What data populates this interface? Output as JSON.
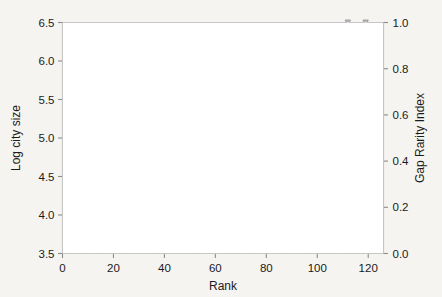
{
  "chart_data": {
    "type": "scatter",
    "title": "",
    "subtitle": "",
    "xlabel": "Rank",
    "ylabel": "Log city size",
    "y2label": "Gap Rarity Index",
    "xlim": [
      0,
      126
    ],
    "ylim": [
      3.5,
      6.5
    ],
    "y2lim": [
      0.0,
      1.0
    ],
    "xticks": [
      0,
      20,
      40,
      60,
      80,
      100,
      120
    ],
    "xticklabels": [
      "0",
      "20",
      "40",
      "60",
      "80",
      "100",
      "120"
    ],
    "yticks": [
      3.5,
      4.0,
      4.5,
      5.0,
      5.5,
      6.0,
      6.5
    ],
    "yticklabels": [
      "3.5",
      "4.0",
      "4.5",
      "5.0",
      "5.5",
      "6.0",
      "6.5"
    ],
    "y2ticks": [
      0.0,
      0.2,
      0.4,
      0.6,
      0.8,
      1.0
    ],
    "y2ticklabels": [
      "0.0",
      "0.2",
      "0.4",
      "0.6",
      "0.8",
      "1.0"
    ],
    "grid": false,
    "legend": null,
    "colors": {
      "city_size_series": "#111111",
      "gap_rarity_series": "#9a9a9a",
      "frame": "#8c8c8c",
      "background": "#f5f4f1"
    },
    "series": [
      {
        "name": "Log city size",
        "axis": "left",
        "marker": "filled-circle",
        "values": [
          4.02,
          4.03,
          4.04,
          4.05,
          4.06,
          4.07,
          4.08,
          4.09,
          4.1,
          4.11,
          4.12,
          4.12,
          4.13,
          4.14,
          4.14,
          4.15,
          4.16,
          4.17,
          4.17,
          4.18,
          4.19,
          4.2,
          4.21,
          4.22,
          4.23,
          4.24,
          4.24,
          4.25,
          4.25,
          4.26,
          4.26,
          4.27,
          4.27,
          4.28,
          4.28,
          4.29,
          4.29,
          4.3,
          4.3,
          4.31,
          4.31,
          4.32,
          4.32,
          4.33,
          4.34,
          4.35,
          4.4,
          4.42,
          4.44,
          4.45,
          4.46,
          4.47,
          4.48,
          4.49,
          4.5,
          4.51,
          4.52,
          4.53,
          4.54,
          4.55,
          4.56,
          4.57,
          4.58,
          4.59,
          4.6,
          4.61,
          4.62,
          4.63,
          4.64,
          4.65,
          4.66,
          4.67,
          4.68,
          4.69,
          4.7,
          4.71,
          4.72,
          4.73,
          4.75,
          4.77,
          4.79,
          4.8,
          4.82,
          4.84,
          4.85,
          4.87,
          4.88,
          4.9,
          4.91,
          4.93,
          4.95,
          4.96,
          4.98,
          4.99,
          5.0,
          5.02,
          5.04,
          5.06,
          5.08,
          5.1,
          5.12,
          5.14,
          5.16,
          5.18,
          5.22,
          5.26,
          5.3,
          5.42,
          5.56,
          5.58,
          5.62,
          5.64,
          5.68,
          5.72,
          5.76,
          5.8,
          5.83,
          5.87,
          5.93,
          5.97,
          6.02,
          6.05,
          6.08,
          6.25
        ]
      },
      {
        "name": "Gap Rarity Index",
        "axis": "right",
        "marker": "down-triangle-stem",
        "values": [
          0.02,
          0.01,
          0.02,
          0.01,
          0.02,
          0.01,
          0.02,
          0.01,
          0.02,
          0.05,
          0.01,
          0.02,
          0.01,
          0.02,
          0.01,
          0.02,
          0.01,
          0.02,
          0.01,
          0.02,
          0.04,
          0.01,
          0.02,
          0.01,
          0.3,
          0.01,
          0.02,
          0.01,
          0.02,
          0.01,
          0.02,
          0.01,
          0.02,
          0.01,
          0.02,
          0.04,
          0.01,
          0.02,
          0.04,
          0.01,
          0.02,
          0.01,
          0.02,
          0.01,
          0.11,
          0.01,
          0.47,
          0.02,
          0.01,
          0.08,
          0.02,
          0.1,
          0.01,
          0.02,
          0.11,
          0.01,
          0.13,
          0.02,
          0.01,
          0.02,
          0.01,
          0.02,
          0.01,
          0.06,
          0.02,
          0.01,
          0.02,
          0.01,
          0.02,
          0.04,
          0.01,
          0.08,
          0.02,
          0.44,
          0.01,
          0.02,
          0.06,
          0.01,
          0.21,
          0.02,
          0.01,
          0.1,
          0.55,
          0.02,
          0.01,
          0.05,
          0.55,
          0.02,
          0.7,
          0.01,
          0.19,
          0.02,
          0.35,
          0.01,
          0.02,
          0.08,
          0.01,
          0.48,
          0.02,
          0.16,
          0.01,
          0.4,
          0.08,
          0.02,
          0.12,
          0.52,
          0.02,
          0.22,
          0.01,
          0.58,
          0.02,
          1.0,
          0.01,
          0.85,
          0.02,
          0.36,
          0.3,
          0.28,
          1.0,
          0.02,
          0.43,
          0.17,
          0.01,
          0.38
        ]
      }
    ]
  }
}
